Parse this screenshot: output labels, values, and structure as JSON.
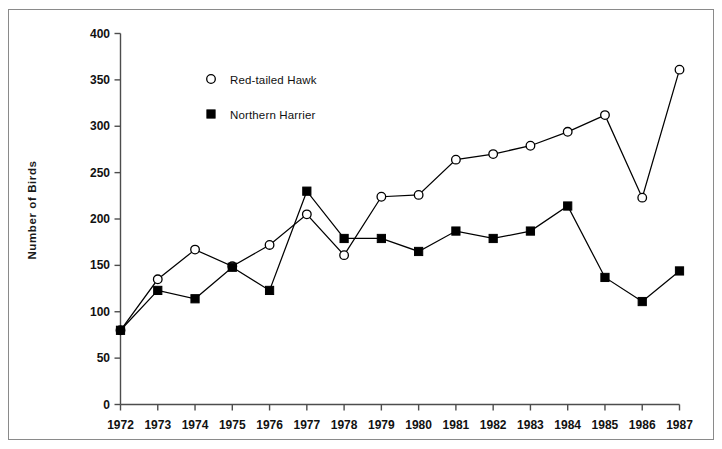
{
  "chart_data": {
    "type": "line",
    "title": "",
    "xlabel": "",
    "ylabel": "Number of Birds",
    "x": [
      1972,
      1973,
      1974,
      1975,
      1976,
      1977,
      1978,
      1979,
      1980,
      1981,
      1982,
      1983,
      1984,
      1985,
      1986,
      1987
    ],
    "xtick_labels": [
      "1972",
      "1973",
      "1974",
      "1975",
      "1976",
      "1977",
      "1978",
      "1979",
      "1980",
      "1981",
      "1982",
      "1983",
      "1984",
      "1985",
      "1986",
      "1987"
    ],
    "ytick_labels": [
      "0",
      "50",
      "100",
      "150",
      "200",
      "250",
      "300",
      "350",
      "400"
    ],
    "ytick_values": [
      0,
      50,
      100,
      150,
      200,
      250,
      300,
      350,
      400
    ],
    "ylim": [
      0,
      400
    ],
    "xlim": [
      1972,
      1987
    ],
    "grid": false,
    "legend_position": "upper-left-inside",
    "series": [
      {
        "name": "Red-tailed Hawk",
        "marker": "open-circle",
        "color": "#000000",
        "values": [
          80,
          135,
          167,
          149,
          172,
          205,
          161,
          224,
          226,
          264,
          270,
          279,
          294,
          312,
          223,
          361
        ]
      },
      {
        "name": "Northern Harrier",
        "marker": "filled-square",
        "color": "#000000",
        "values": [
          80,
          123,
          114,
          148,
          123,
          230,
          179,
          179,
          165,
          187,
          179,
          187,
          214,
          137,
          111,
          144
        ]
      }
    ]
  },
  "legend": {
    "items": [
      {
        "label": "Red-tailed Hawk",
        "marker": "open-circle"
      },
      {
        "label": "Northern Harrier",
        "marker": "filled-square"
      }
    ]
  },
  "axes": {
    "y_axis_title": "Number of Birds"
  }
}
